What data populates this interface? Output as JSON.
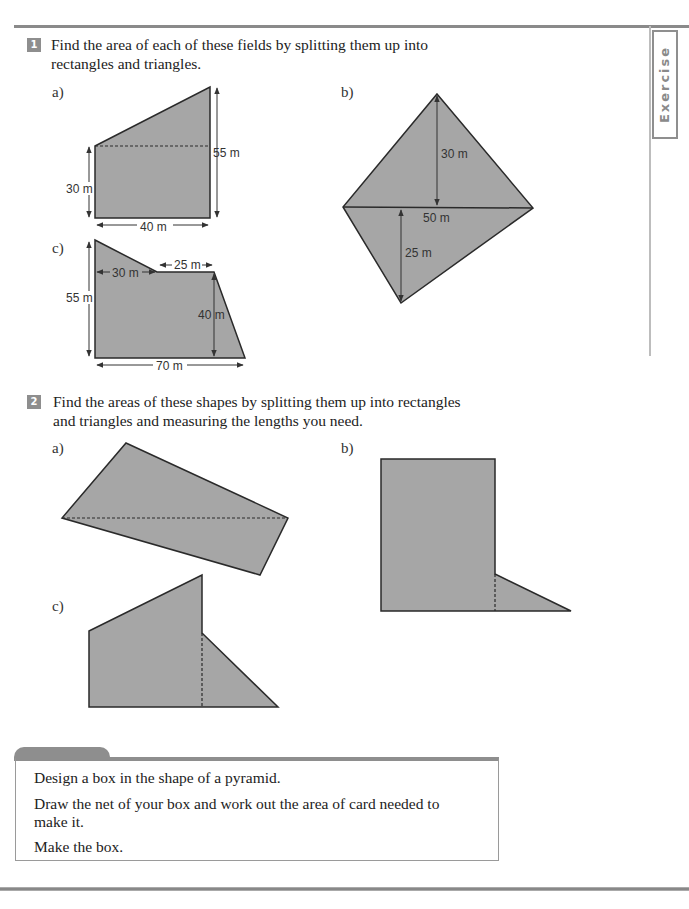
{
  "sidebar_tab": {
    "label": "Exercise"
  },
  "question1": {
    "number": "1",
    "text_line1": "Find the area of each of these fields by splitting them up into",
    "text_line2": "rectangles and triangles.",
    "parts": {
      "a": {
        "label": "a)",
        "dims": {
          "left_height": "30 m",
          "right_height": "55 m",
          "base": "40 m"
        }
      },
      "b": {
        "label": "b)",
        "dims": {
          "top_height": "30 m",
          "diagonal": "50 m",
          "bottom_height": "25 m"
        }
      },
      "c": {
        "label": "c)",
        "dims": {
          "left_height": "55 m",
          "top_left": "30 m",
          "top_middle": "25 m",
          "right_height": "40 m",
          "base": "70 m"
        }
      }
    }
  },
  "question2": {
    "number": "2",
    "text_line1": "Find the areas of these shapes by splitting them up into rectangles",
    "text_line2": "and triangles and measuring the lengths you need.",
    "parts": {
      "a": {
        "label": "a)"
      },
      "b": {
        "label": "b)"
      },
      "c": {
        "label": "c)"
      }
    }
  },
  "design_task": {
    "line1": "Design a box in the shape of a pyramid.",
    "line2a": "Draw the net of your box and work out the area of card needed to",
    "line2b": "make it.",
    "line3": "Make the box."
  },
  "colors": {
    "shape_fill": "#a6a6a6",
    "shape_stroke": "#2a2a2a",
    "accent_grey": "#8e8e8e"
  }
}
